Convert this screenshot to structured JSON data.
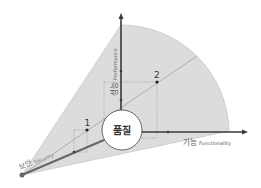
{
  "center": {
    "label": "품질"
  },
  "axes": {
    "performance": {
      "label_ko": "성능",
      "label_en": "Performance"
    },
    "functionality": {
      "label_ko": "기능",
      "label_en": "Functionality"
    },
    "security": {
      "label_ko": "보안",
      "label_en": "Security"
    }
  },
  "points": [
    {
      "label": "1"
    },
    {
      "label": "2"
    }
  ],
  "colors": {
    "fan": "#d9d9d9",
    "axis": "#3a3a3a",
    "guide": "#8c8c8c",
    "text": "#555555"
  }
}
